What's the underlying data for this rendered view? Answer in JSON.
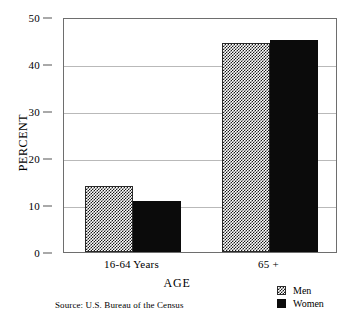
{
  "chart_data": {
    "type": "bar",
    "title": "",
    "categories": [
      "16-64 Years",
      "65 +"
    ],
    "series": [
      {
        "name": "Men",
        "values": [
          14.0,
          44.5
        ],
        "pattern": "checkered",
        "color": "#1a1a1a"
      },
      {
        "name": "Women",
        "values": [
          10.8,
          45.2
        ],
        "pattern": "solid",
        "color": "#0b0b0b"
      }
    ],
    "xlabel": "AGE",
    "ylabel": "PERCENT",
    "ylim": [
      0,
      50
    ],
    "yticks": [
      0,
      10,
      20,
      30,
      40,
      50
    ],
    "ytick_labels": [
      "0",
      "10",
      "20",
      "30",
      "40",
      "50"
    ],
    "grid": true,
    "legend_position": "bottom-right",
    "source": "Source:  U.S. Bureau of the Census"
  },
  "axes": {
    "y_title": "PERCENT",
    "x_title": "AGE",
    "ticks": [
      {
        "label": "50",
        "value": 50
      },
      {
        "label": "40",
        "value": 40
      },
      {
        "label": "30",
        "value": 30
      },
      {
        "label": "20",
        "value": 20
      },
      {
        "label": "10",
        "value": 10
      },
      {
        "label": "0",
        "value": 0
      }
    ],
    "categories": [
      {
        "label": "16-64 Years"
      },
      {
        "label": "65 +"
      }
    ]
  },
  "legend": {
    "items": [
      {
        "label": "Men",
        "swatch": "checkered-swatch-icon"
      },
      {
        "label": "Women",
        "swatch": "solid-black-swatch-icon"
      }
    ]
  },
  "footer": {
    "source": "Source:  U.S. Bureau of the Census"
  }
}
